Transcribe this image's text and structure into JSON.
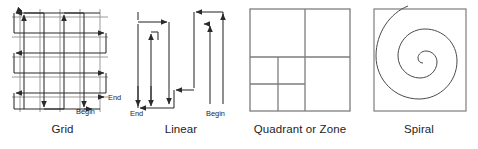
{
  "page": {
    "width": 478,
    "height": 149,
    "background_color": "#ffffff",
    "line_color": "#3c3c3c",
    "grid_color": "#8a8a8a",
    "text_color": "#1d1d1d"
  },
  "figures": [
    {
      "id": "grid",
      "caption": "Grid",
      "type": "grid-search-pattern",
      "labels": {
        "end": "End",
        "begin": "Begin"
      }
    },
    {
      "id": "linear",
      "caption": "Linear",
      "type": "linear-search-pattern",
      "labels": {
        "end": "End",
        "begin": "Begin"
      }
    },
    {
      "id": "quadrant",
      "caption": "Quadrant or Zone",
      "type": "quadrant-zone-search-pattern",
      "labels": {
        "end": "",
        "begin": ""
      }
    },
    {
      "id": "spiral",
      "caption": "Spiral",
      "type": "spiral-search-pattern",
      "labels": {
        "end": "",
        "begin": ""
      }
    }
  ]
}
